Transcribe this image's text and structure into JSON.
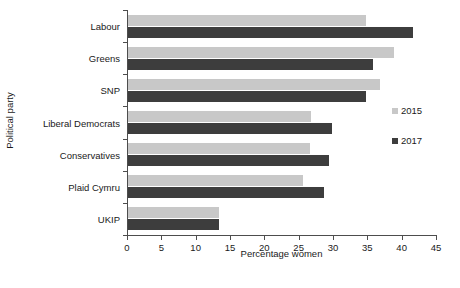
{
  "chart_data": {
    "type": "bar",
    "orientation": "horizontal",
    "title": "",
    "xlabel": "Percentage women",
    "ylabel": "Political party",
    "categories": [
      "Labour",
      "Greens",
      "SNP",
      "Liberal Democrats",
      "Conservatives",
      "Plaid Cymru",
      "UKIP"
    ],
    "series": [
      {
        "name": "2015",
        "color": "#c8c8c8",
        "values": [
          34.6,
          38.8,
          36.7,
          26.7,
          26.5,
          25.5,
          13.3
        ]
      },
      {
        "name": "2017",
        "color": "#3d3d3d",
        "values": [
          41.5,
          35.7,
          34.7,
          29.7,
          29.3,
          28.6,
          13.3
        ]
      }
    ],
    "xlim": [
      0,
      45
    ],
    "xticks": [
      0,
      5,
      10,
      15,
      20,
      25,
      30,
      35,
      40,
      45
    ],
    "xticklabels": [
      "0",
      "5",
      "10",
      "15",
      "20",
      "25",
      "30",
      "35",
      "40",
      "45"
    ],
    "grid": false,
    "legend": {
      "position": "right",
      "entries": [
        "2015",
        "2017"
      ]
    }
  }
}
